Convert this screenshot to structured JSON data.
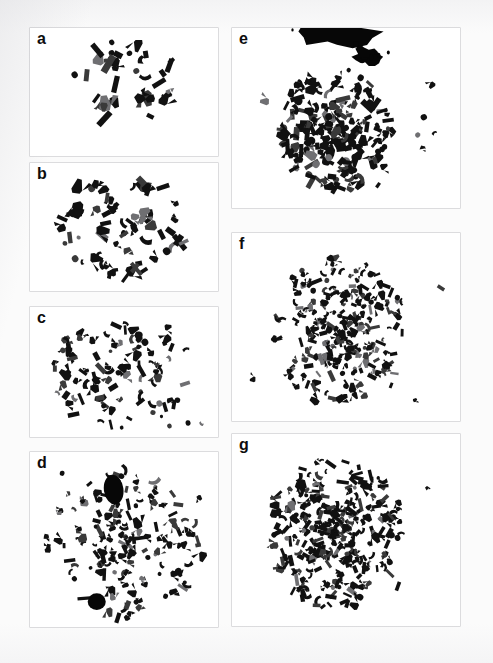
{
  "figure": {
    "type": "multi-panel-micrograph-figure",
    "panel_count": 7,
    "columns": 2,
    "background_color": "#fbfbfb",
    "panel_background_color": "#ffffff",
    "chromosome_color": "#111111"
  },
  "panels": [
    {
      "id": "a",
      "label": "a",
      "column": "left",
      "row": 1,
      "x": 30,
      "y": 28,
      "width": 188,
      "height": 128,
      "density": "sparse",
      "chromosome_count": 34,
      "notes": "loose scattered metaphase, few isolated elements at lower left",
      "has_dark_mass": false,
      "seed": 11
    },
    {
      "id": "b",
      "label": "b",
      "column": "left",
      "row": 2,
      "x": 30,
      "y": 163,
      "width": 188,
      "height": 128,
      "density": "moderate",
      "chromosome_count": 62,
      "notes": "moderately spread metaphase with outlying group at left margin",
      "has_dark_mass": false,
      "seed": 23
    },
    {
      "id": "c",
      "label": "c",
      "column": "left",
      "row": 3,
      "x": 30,
      "y": 307,
      "width": 188,
      "height": 130,
      "density": "moderate-dense",
      "chromosome_count": 88,
      "notes": "evenly distributed metaphase, rounded outline",
      "has_dark_mass": false,
      "seed": 37
    },
    {
      "id": "d",
      "label": "d",
      "column": "left",
      "row": 4,
      "x": 30,
      "y": 452,
      "width": 188,
      "height": 175,
      "density": "dense",
      "chromosome_count": 150,
      "notes": "large spread containing two prominent solid dark bodies (nucleoli / heterochromatic masses)",
      "has_dark_mass": true,
      "dark_masses": [
        {
          "cx": 0.445,
          "cy": 0.215,
          "rx": 0.052,
          "ry": 0.085,
          "shape": "oval"
        },
        {
          "cx": 0.355,
          "cy": 0.855,
          "rx": 0.048,
          "ry": 0.048,
          "shape": "round"
        }
      ],
      "seed": 53
    },
    {
      "id": "e",
      "label": "e",
      "column": "right",
      "row": 1,
      "x": 232,
      "y": 28,
      "width": 228,
      "height": 180,
      "density": "very-dense",
      "chromosome_count": 190,
      "notes": "compact heavily stained metaphase with a large irregular dark mass clipped at the top edge",
      "has_dark_mass": true,
      "dark_masses": [
        {
          "cx": 0.46,
          "cy": 0.02,
          "rx": 0.18,
          "ry": 0.1,
          "shape": "irregular-clipped"
        },
        {
          "cx": 0.6,
          "cy": 0.16,
          "rx": 0.07,
          "ry": 0.055,
          "shape": "irregular"
        }
      ],
      "seed": 71
    },
    {
      "id": "f",
      "label": "f",
      "column": "right",
      "row": 2,
      "x": 232,
      "y": 233,
      "width": 228,
      "height": 188,
      "density": "very-dense",
      "chromosome_count": 230,
      "notes": "broad circular spread of small chromosomes, denser at the centre",
      "has_dark_mass": false,
      "seed": 89
    },
    {
      "id": "g",
      "label": "g",
      "column": "right",
      "row": 3,
      "x": 232,
      "y": 434,
      "width": 228,
      "height": 192,
      "density": "extremely-dense",
      "chromosome_count": 300,
      "notes": "very large polyploid spread, strongly overlapping chromosomes with lighter peripheral elements",
      "has_dark_mass": false,
      "seed": 101
    }
  ],
  "labels": {
    "a": "a",
    "b": "b",
    "c": "c",
    "d": "d",
    "e": "e",
    "f": "f",
    "g": "g"
  }
}
